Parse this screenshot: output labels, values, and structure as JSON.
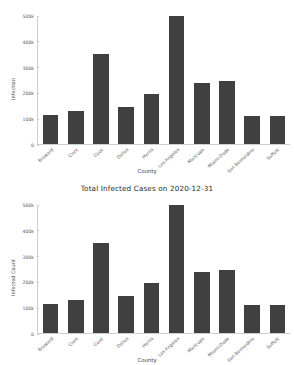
{
  "chart_data": [
    {
      "type": "bar",
      "id": "top-chart",
      "title": "",
      "xlabel": "County",
      "ylabel": "Infection",
      "categories": [
        "Broward",
        "Clark",
        "Cook",
        "Dallas",
        "Harris",
        "Los Angeles",
        "Maricopa",
        "Miami-Dade",
        "San Bernardino",
        "Suffolk"
      ],
      "values": [
        115000,
        130000,
        350000,
        145000,
        195000,
        500000,
        240000,
        245000,
        110000,
        108000
      ],
      "ylim": [
        0,
        500000
      ],
      "yticks": [
        0,
        100000,
        200000,
        300000,
        400000,
        500000
      ],
      "ytick_labels": [
        "0",
        "100k",
        "200k",
        "300k",
        "400k",
        "500k"
      ],
      "grid": false,
      "legend": "none",
      "bar_color": "#404040"
    },
    {
      "type": "bar",
      "id": "bottom-chart",
      "title": "Total Infected Cases on 2020-12-31",
      "xlabel": "County",
      "ylabel": "Infected Count",
      "categories": [
        "Broward",
        "Clark",
        "Cook",
        "Dallas",
        "Harris",
        "Los Angeles",
        "Maricopa",
        "Miami-Dade",
        "San Bernardino",
        "Suffolk"
      ],
      "values": [
        115000,
        130000,
        350000,
        145000,
        195000,
        500000,
        240000,
        245000,
        110000,
        108000
      ],
      "ylim": [
        0,
        500000
      ],
      "yticks": [
        0,
        100000,
        200000,
        300000,
        400000,
        500000
      ],
      "ytick_labels": [
        "0",
        "100k",
        "200k",
        "300k",
        "400k",
        "500k"
      ],
      "grid": false,
      "legend": "none",
      "bar_color": "#404040"
    }
  ]
}
